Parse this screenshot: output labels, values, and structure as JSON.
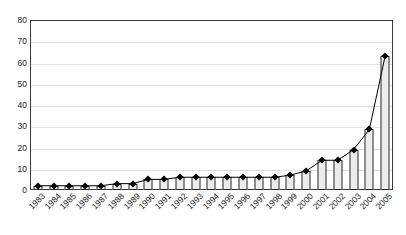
{
  "chart_data": {
    "type": "bar",
    "title": "",
    "subtitle": "",
    "xlabel": "",
    "ylabel": "",
    "ylim": [
      0,
      80
    ],
    "ytick_step": 10,
    "yticks": [
      "80",
      "70",
      "60",
      "50",
      "40",
      "30",
      "20",
      "10",
      "0"
    ],
    "grid": true,
    "legend": "none",
    "categories": [
      "1983",
      "1984",
      "1985",
      "1986",
      "1987",
      "1988",
      "1989",
      "1990",
      "1991",
      "1992",
      "1993",
      "1994",
      "1995",
      "1996",
      "1997",
      "1998",
      "1999",
      "2000",
      "2001",
      "2002",
      "2003",
      "2004",
      "2005"
    ],
    "values": [
      2,
      2,
      2,
      2,
      2,
      3,
      3,
      5,
      5,
      6,
      6,
      6,
      6,
      6,
      6,
      6,
      7,
      9,
      14,
      14,
      19,
      28.5,
      63
    ],
    "series": [
      {
        "name": "series-1",
        "render": "bar-and-line",
        "values": [
          2,
          2,
          2,
          2,
          2,
          3,
          3,
          5,
          5,
          6,
          6,
          6,
          6,
          6,
          6,
          6,
          7,
          9,
          14,
          14,
          19,
          28.5,
          63
        ]
      }
    ],
    "colors": {
      "bar_fill": "#ececec",
      "bar_stroke": "#2b2b2b",
      "line": "#000000",
      "marker": "#000000",
      "gridline": "#e2e2e2",
      "frame": "#3a3a3a",
      "text": "#1a1a1a",
      "background": "#ffffff"
    }
  }
}
